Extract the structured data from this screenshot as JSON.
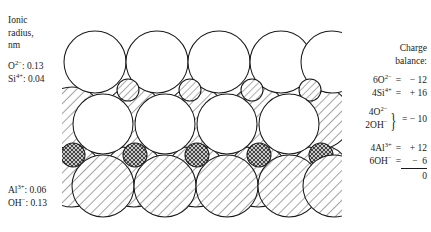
{
  "figure": {
    "type": "crystal-structure-schematic"
  },
  "left_panel": {
    "heading_lines": [
      "Ionic",
      "radius,",
      "nm"
    ],
    "values": [
      {
        "ion": "O",
        "charge": "2−",
        "radius": "0.13",
        "text": "O2−: 0.13"
      },
      {
        "ion": "Si",
        "charge": "4+",
        "radius": "0.04",
        "text": "Si4+: 0.04"
      }
    ],
    "lower_values": [
      {
        "ion": "Al",
        "charge": "3+",
        "radius": "0.06",
        "text": "Al3+: 0.06"
      },
      {
        "ion": "OH",
        "charge": "−",
        "radius": "0.13",
        "text": "OH−: 0.13"
      }
    ]
  },
  "charge_balance": {
    "title_lines": [
      "Charge",
      "balance:"
    ],
    "group1": [
      {
        "count": "6",
        "species": "O",
        "charge": "2−",
        "equals": "=",
        "value": "− 12"
      },
      {
        "count": "4",
        "species": "Si",
        "charge": "4+",
        "equals": "=",
        "value": "+ 16"
      }
    ],
    "group2": {
      "terms": [
        {
          "count": "4",
          "species": "O",
          "charge": "2−"
        },
        {
          "count": "2",
          "species": "OH",
          "charge": "−"
        }
      ],
      "equals": "=",
      "value": "− 10"
    },
    "group3": [
      {
        "count": "4",
        "species": "Al",
        "charge": "3+",
        "equals": "=",
        "value": "+ 12"
      },
      {
        "count": "6",
        "species": "OH",
        "charge": "−",
        "equals": "=",
        "value": "−  6"
      }
    ],
    "total": "0"
  },
  "diagram_layers": {
    "top_row": {
      "label": "oxygen-layer",
      "sphere_count": 5,
      "fill": "white"
    },
    "top_interstitial": {
      "label": "silicon-ions",
      "sphere_count": 4,
      "fill": "diagonal-hatch"
    },
    "middle_row": {
      "label": "hydroxyl-oxygen-layer",
      "sphere_count": 8,
      "fill": "mixed-hatch-white"
    },
    "bottom_interstitial": {
      "label": "aluminum-ions",
      "sphere_count": 4,
      "fill": "cross-hatch"
    },
    "bottom_row": {
      "label": "hydroxyl-layer",
      "sphere_count": 9,
      "fill": "diagonal-hatch"
    }
  },
  "colors": {
    "stroke": "#1a1a1a",
    "background": "#ffffff",
    "hatch": "#555555"
  }
}
